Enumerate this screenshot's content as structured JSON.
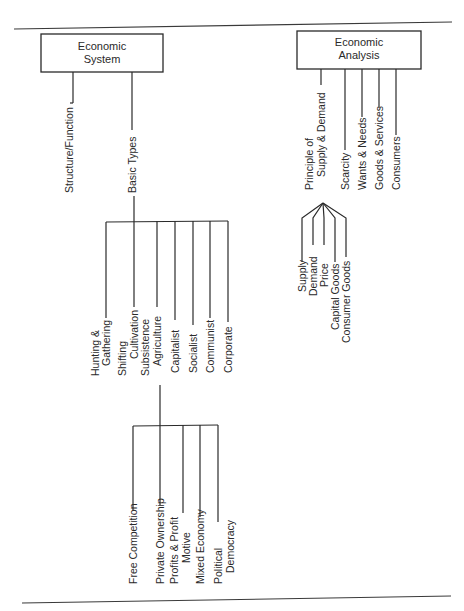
{
  "diagram": {
    "type": "tree",
    "orientation": "labels rotated 90° counter-clockwise",
    "colors": {
      "ink": "#2a2a2a",
      "background": "#ffffff"
    },
    "boxes": {
      "economic_system": {
        "line1": "Economic",
        "line2": "System"
      },
      "economic_analysis": {
        "line1": "Economic",
        "line2": "Analysis"
      }
    },
    "economic_system_branches": {
      "structure_function": "Structure/Function",
      "basic_types": "Basic Types"
    },
    "basic_types": [
      {
        "line1": "Hunting &",
        "line2": "Gathering"
      },
      {
        "line1": "Shifting",
        "line2": "Cultivation"
      },
      {
        "line1": "Subsistence",
        "line2": "Agriculture"
      },
      {
        "line1": "Capitalist",
        "line2": ""
      },
      {
        "line1": "Socialist",
        "line2": ""
      },
      {
        "line1": "Communist",
        "line2": ""
      },
      {
        "line1": "Corporate",
        "line2": ""
      }
    ],
    "capitalist_features": [
      {
        "line1": "Free Competition",
        "line2": ""
      },
      {
        "line1": "Private Ownership",
        "line2": ""
      },
      {
        "line1": "Profits & Profit",
        "line2": "Motive"
      },
      {
        "line1": "Mixed Economy",
        "line2": ""
      },
      {
        "line1": "Political",
        "line2": "Democracy"
      }
    ],
    "economic_analysis_branches": [
      {
        "line1": "Principle of",
        "line2": "Supply & Demand"
      },
      {
        "line1": "Scarcity",
        "line2": ""
      },
      {
        "line1": "Wants & Needs",
        "line2": ""
      },
      {
        "line1": "Goods & Services",
        "line2": ""
      },
      {
        "line1": "Consumers",
        "line2": ""
      }
    ],
    "supply_demand_components": [
      "Supply",
      "Demand",
      "Price",
      "Capital Goods",
      "Consumer Goods"
    ]
  }
}
